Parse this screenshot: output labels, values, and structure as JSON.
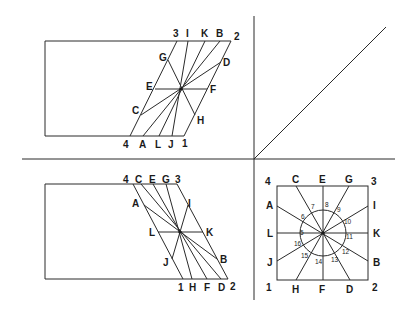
{
  "figure": {
    "panels": [
      {
        "id": "top-left",
        "description": "rectangle with parallelogram slanted right, lines radiating from center",
        "corner_labels": [
          "1",
          "2",
          "3",
          "4"
        ],
        "top_edge_labels": [
          "3",
          "I",
          "K",
          "B",
          "2"
        ],
        "bottom_edge_labels": [
          "4",
          "A",
          "L",
          "J",
          "1"
        ],
        "left_side_labels": [
          "G",
          "E",
          "C"
        ],
        "right_side_labels": [
          "D",
          "F",
          "H"
        ]
      },
      {
        "id": "top-right",
        "description": "single diagonal line from origin"
      },
      {
        "id": "bottom-left",
        "description": "rectangle with parallelogram slanted left, lines radiating from center",
        "top_edge_labels": [
          "4",
          "C",
          "E",
          "G",
          "3"
        ],
        "bottom_edge_labels": [
          "1",
          "H",
          "F",
          "D",
          "2"
        ],
        "left_side_labels": [
          "A",
          "L",
          "J"
        ],
        "right_side_labels": [
          "I",
          "K",
          "B"
        ]
      },
      {
        "id": "bottom-right",
        "description": "square with radiating lines and circle with numbered points",
        "corner_labels": {
          "top_left": "4",
          "top_right": "3",
          "bottom_left": "1",
          "bottom_right": "2"
        },
        "top_edge_labels": [
          "C",
          "E",
          "G"
        ],
        "bottom_edge_labels": [
          "H",
          "F",
          "D"
        ],
        "left_edge_labels": [
          "A",
          "L",
          "J"
        ],
        "right_edge_labels": [
          "I",
          "K",
          "B"
        ],
        "circle_numbers": [
          "5",
          "6",
          "7",
          "8",
          "9",
          "10",
          "11",
          "12",
          "13",
          "14",
          "15",
          "16"
        ]
      }
    ]
  },
  "labels": {
    "tl": {
      "p3": "3",
      "pI": "I",
      "pK": "K",
      "pB": "B",
      "p2": "2",
      "pG": "G",
      "pD": "D",
      "pE": "E",
      "pF": "F",
      "pC": "C",
      "pH": "H",
      "p4": "4",
      "pA": "A",
      "pL": "L",
      "pJ": "J",
      "p1": "1"
    },
    "bl": {
      "p4": "4",
      "pC": "C",
      "pE": "E",
      "pG": "G",
      "p3": "3",
      "pA": "A",
      "pI": "I",
      "pL": "L",
      "pK": "K",
      "pJ": "J",
      "pB": "B",
      "p1": "1",
      "pH": "H",
      "pF": "F",
      "pD": "D",
      "p2": "2"
    },
    "br": {
      "p4": "4",
      "pC": "C",
      "pE": "E",
      "pG": "G",
      "p3": "3",
      "pA": "A",
      "pI": "I",
      "pL": "L",
      "pK": "K",
      "pJ": "J",
      "pB": "B",
      "p1": "1",
      "pH": "H",
      "pF": "F",
      "pD": "D",
      "p2": "2",
      "n5": "5",
      "n6": "6",
      "n7": "7",
      "n8": "8",
      "n9": "9",
      "n10": "10",
      "n11": "11",
      "n12": "12",
      "n13": "13",
      "n14": "14",
      "n15": "15",
      "n16": "16"
    }
  }
}
